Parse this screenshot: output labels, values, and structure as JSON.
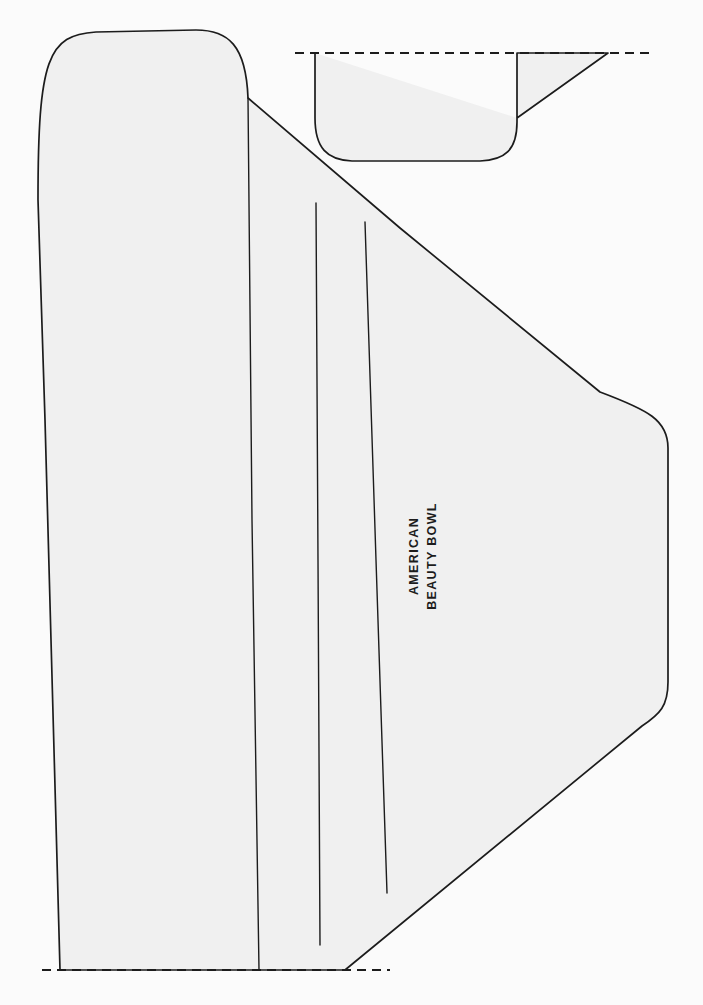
{
  "document": {
    "kind": "craft-pattern-drawing",
    "title": "American Beauty Bowl",
    "background_color": "#fbfbfb",
    "piece_fill_color": "#f0f0f0",
    "line_color": "#1c1c1c"
  },
  "labels": {
    "piece_name_line1": "AMERICAN",
    "piece_name_line2": "BEAUTY BOWL",
    "orientation": "rotated-90-ccw"
  },
  "pieces": [
    {
      "id": "main-panel",
      "name": "main-wedge-panel",
      "description": "Large fan / wedge shaped pattern panel with rounded top-left corner, long gently curved left edge, and a long diagonal right edge tapering to a rounded right side.",
      "outline_path": "M 60 970 L 45 420 L 38 200 C 38 58 48 35 96 32 L 196 30 C 228 30 246 45 248 98 L 400 228 L 600 392 C 648 410 668 420 668 448 L 668 682 C 668 706 660 714 642 726 L 345 970 Z",
      "fill": "#f0f0f0",
      "stroke": "#1c1c1c"
    },
    {
      "id": "bowl-profile",
      "name": "bowl-cross-section",
      "description": "Bowl / trough cross-section profile at top right, open at the top along the dashed fold line, with a rounded U bottom and a diagonal rim flare on the right.",
      "outline_path": "M 315 53 L 315 118 C 315 148 327 160 352 161 L 480 161 C 505 160 517 150 517 122 L 517 53 L 608 53 L 517 118",
      "fill": "#f0f0f0",
      "stroke": "#1c1c1c"
    }
  ],
  "fold_lines": [
    {
      "id": "fold-1",
      "name": "panel-division-line-long",
      "description": "Full-height division line separating the left border band from the fan body.",
      "path": "M 248 98 L 252 520 L 259 970"
    },
    {
      "id": "fold-2",
      "name": "pleat-fold-line-inner",
      "description": "Inner pleat fold line, starts below the top edge and stops above the bottom dashed line.",
      "path": "M 316 203 L 318 560 L 320 945"
    },
    {
      "id": "fold-3",
      "name": "pleat-fold-line-outer",
      "description": "Outer pleat fold line, starts below the top edge and stops well above the bottom dashed line.",
      "path": "M 365 222 L 376 560 L 387 893"
    }
  ],
  "dashed_lines": [
    {
      "id": "dashed-top",
      "name": "top-fold-placement-line",
      "description": "Horizontal dashed fold / place-on-fold line across the top of the bowl profile.",
      "x1": 295,
      "y1": 53,
      "x2": 652,
      "y2": 53,
      "dash": "9 6"
    },
    {
      "id": "dashed-bottom",
      "name": "bottom-fold-placement-line",
      "description": "Horizontal dashed fold / place-on-fold line along the bottom edge of the main panel.",
      "x1": 42,
      "y1": 970,
      "x2": 390,
      "y2": 970,
      "dash": "9 6"
    }
  ],
  "text_block": {
    "name": "piece-label",
    "x": 418,
    "y": 556,
    "rotation_deg": -90,
    "line_height": 18,
    "font_size_px": 12.5,
    "letter_spacing_px": 1.35,
    "bold": true
  }
}
